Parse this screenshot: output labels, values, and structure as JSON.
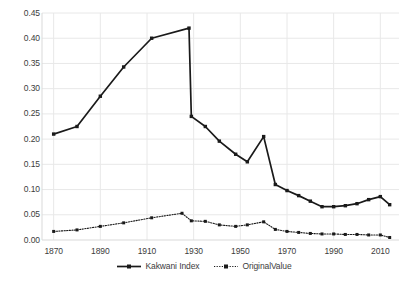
{
  "chart_data": {
    "type": "line",
    "title": "",
    "subtitle": "",
    "xlabel": "",
    "ylabel": "",
    "xlim": [
      1865,
      2018
    ],
    "ylim": [
      0.0,
      0.45
    ],
    "grid": true,
    "grid_axis": "y",
    "legend_position": "bottom-center",
    "x_ticks": [
      "1870",
      "1890",
      "1910",
      "1930",
      "1950",
      "1970",
      "1990",
      "2010"
    ],
    "x_tick_values": [
      1870,
      1890,
      1910,
      1930,
      1950,
      1970,
      1990,
      2010
    ],
    "y_ticks": [
      "0.00",
      "0.05",
      "0.10",
      "0.15",
      "0.20",
      "0.25",
      "0.30",
      "0.35",
      "0.40",
      "0.45"
    ],
    "y_tick_values": [
      0.0,
      0.05,
      0.1,
      0.15,
      0.2,
      0.25,
      0.3,
      0.35,
      0.4,
      0.45
    ],
    "series": [
      {
        "name": "Kakwani Index",
        "color": "#1a1a1a",
        "line_style": "solid",
        "marker": "square",
        "x": [
          1870,
          1880,
          1890,
          1900,
          1912,
          1928,
          1929,
          1935,
          1941,
          1948,
          1953,
          1960,
          1965,
          1970,
          1975,
          1980,
          1985,
          1990,
          1995,
          2000,
          2005,
          2010,
          2014
        ],
        "values": [
          0.21,
          0.225,
          0.285,
          0.343,
          0.4,
          0.42,
          0.245,
          0.225,
          0.196,
          0.17,
          0.155,
          0.205,
          0.11,
          0.098,
          0.088,
          0.077,
          0.066,
          0.066,
          0.068,
          0.072,
          0.08,
          0.086,
          0.07
        ]
      },
      {
        "name": "OriginalValue",
        "color": "#1a1a1a",
        "line_style": "dotted",
        "marker": "square",
        "x": [
          1870,
          1880,
          1890,
          1900,
          1912,
          1925,
          1929,
          1935,
          1941,
          1948,
          1953,
          1960,
          1965,
          1970,
          1975,
          1980,
          1985,
          1990,
          1995,
          2000,
          2005,
          2010,
          2014
        ],
        "values": [
          0.017,
          0.02,
          0.027,
          0.034,
          0.044,
          0.053,
          0.038,
          0.037,
          0.03,
          0.027,
          0.03,
          0.036,
          0.021,
          0.017,
          0.015,
          0.013,
          0.012,
          0.012,
          0.011,
          0.011,
          0.01,
          0.01,
          0.005
        ]
      }
    ],
    "legend": [
      {
        "label": "Kakwani Index",
        "line_style": "solid"
      },
      {
        "label": "OriginalValue",
        "line_style": "dotted"
      }
    ],
    "colors": {
      "line": "#1a1a1a",
      "grid": "#e8e8e8",
      "axis": "#d9d9d9",
      "text": "#3c3c3c",
      "background": "#ffffff"
    }
  }
}
